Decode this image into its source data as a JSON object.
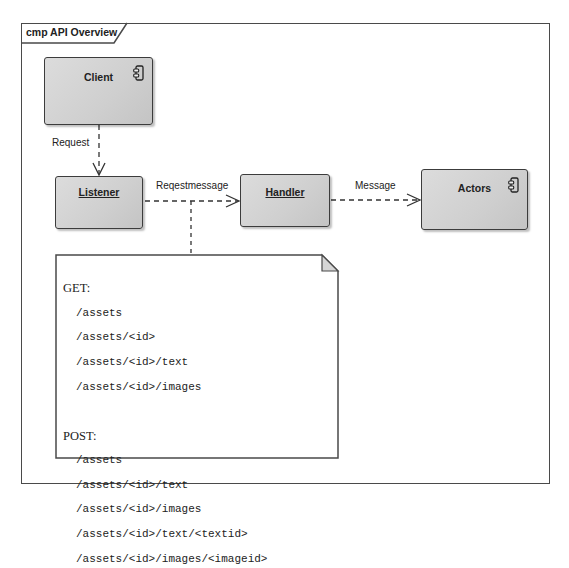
{
  "diagram": {
    "frame_title": "cmp API Overview",
    "components": [
      {
        "id": "client",
        "label": "Client",
        "underlined": false,
        "icon": "component-icon"
      },
      {
        "id": "listener",
        "label": "Listener",
        "underlined": true,
        "icon": null
      },
      {
        "id": "handler",
        "label": "Handler",
        "underlined": true,
        "icon": null
      },
      {
        "id": "actors",
        "label": "Actors",
        "underlined": false,
        "icon": "component-icon"
      }
    ],
    "connectors": [
      {
        "from": "client",
        "to": "listener",
        "label": "Request",
        "style": "dashed-open-arrow"
      },
      {
        "from": "listener",
        "to": "handler",
        "label": "Reqestmessage",
        "style": "dashed-open-arrow"
      },
      {
        "from": "handler",
        "to": "actors",
        "label": "Message",
        "style": "dashed-open-arrow"
      }
    ],
    "note": {
      "get_label": "GET:",
      "get_paths": [
        "/assets",
        "/assets/<id>",
        "/assets/<id>/text",
        "/assets/<id>/images"
      ],
      "post_label": "POST:",
      "post_paths": [
        "/assets",
        "/assets/<id>/text",
        "/assets/<id>/images",
        "/assets/<id>/text/<textid>",
        "/assets/<id>/images/<imageid>"
      ]
    },
    "colors": {
      "component_fill": "#d3d3d3",
      "border": "#3c3c3c",
      "background": "#ffffff"
    }
  }
}
